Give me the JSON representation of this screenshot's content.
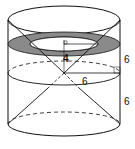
{
  "diagram": {
    "type": "geometry-solid",
    "colors": {
      "stroke": "#111111",
      "ring_fill": "#8a8a8a",
      "background": "#ffffff"
    },
    "labels": {
      "inner_radius": "4",
      "radius": "6",
      "upper_height": "6",
      "lower_height": "6"
    }
  }
}
